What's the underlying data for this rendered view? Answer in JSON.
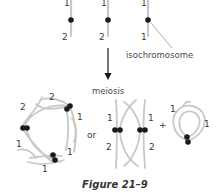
{
  "top_row": {
    "chromosomes": [
      {
        "top_label": "1",
        "bottom_label": "2"
      },
      {
        "top_label": "1",
        "bottom_label": "2"
      },
      {
        "top_label": "1",
        "bottom_label": "1"
      }
    ],
    "callout": "isochromosome"
  },
  "process_label": "meiosis",
  "bottom_row": {
    "ring_labels": {
      "top_left": "2",
      "top_right": "2",
      "right_upper": "1",
      "left_lower": "1",
      "right_lower": "1",
      "bottom": "1"
    },
    "or_text": "or",
    "pair_labels": {
      "left_top": "1",
      "left_bottom": "2",
      "right_top": "1",
      "right_bottom": "2"
    },
    "plus_text": "+",
    "loop_labels": {
      "left": "1",
      "right": "1"
    }
  },
  "caption": "Figure 21–9",
  "colors": {
    "chromosome": "#c8c8c8",
    "centromere": "#1a1a1a",
    "text": "#3a3a3a"
  }
}
